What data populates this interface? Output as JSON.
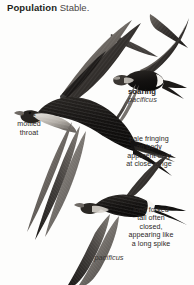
{
  "page": {
    "background_color": "#fdfdfc",
    "text_color": "#2b2726",
    "width": 194,
    "height": 285
  },
  "header": {
    "field_label": "Population",
    "field_value": "Stable."
  },
  "species": {
    "scientific_name": "pacificus"
  },
  "annotations": {
    "throat": {
      "line1": "pale",
      "line2": "mottled",
      "line3": "throat",
      "full": "pale mottled throat"
    },
    "soaring": {
      "pose": "soaring",
      "name": "pacificus"
    },
    "fringing": {
      "line1": "pale fringing",
      "line2": "on body",
      "line3": "apparent only",
      "line4": "at close range",
      "full": "pale fringing on body apparent only at close range"
    },
    "tail": {
      "line1": "long forked",
      "line2": "tail often",
      "line3": "closed,",
      "line4": "appearing like",
      "line5": "a long spike",
      "full": "long forked tail often closed, appearing like a long spike"
    },
    "bottom_name": "pacificus"
  },
  "illustration": {
    "subject": "Pacific Swift (Apus pacificus)",
    "style": "field-guide plate, monochrome ink wash",
    "birds": [
      {
        "name": "large-swift-gliding",
        "view": "upper-side, banking glide, left-facing",
        "features": [
          "pale mottled throat",
          "long scythe wings",
          "forked tail"
        ]
      },
      {
        "name": "soaring-swift",
        "view": "underside, wings spread, soaring",
        "features": [
          "white rump band",
          "spread forked tail"
        ]
      },
      {
        "name": "lower-swift-diving",
        "view": "underside, steep dive, wings swept back",
        "features": [
          "white rump band",
          "long closed spike tail"
        ]
      }
    ],
    "palette": {
      "ink_dark": "#1b1917",
      "ink_mid": "#4e4a47",
      "ink_light": "#8d8984",
      "highlight": "#ffffff"
    }
  }
}
